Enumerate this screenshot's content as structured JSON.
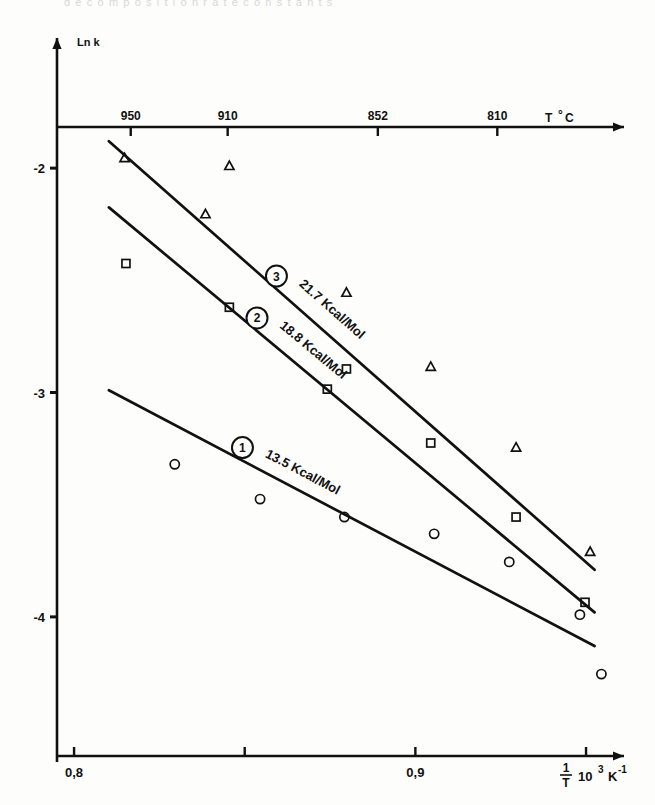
{
  "figure": {
    "kind": "arrhenius-plot",
    "background_color": "#fdfdfc",
    "ink_color": "#111111",
    "top_edge_artifact": "d e c o m p o s i t i o n   r a t e   c o n s t a n t s"
  },
  "chart_data": {
    "type": "scatter",
    "title": "",
    "subtitle": "",
    "xlabel": "1/T  10³ K⁻¹",
    "ylabel": "Ln k",
    "xlim": [
      0.795,
      0.962
    ],
    "ylim": [
      -4.62,
      -1.42
    ],
    "grid": false,
    "legend_position": "inline-on-curve",
    "x_axis": {
      "label": "1/T  10³ K⁻¹",
      "label_parts": {
        "fraction_numerator": "1",
        "fraction_denominator": "T",
        "mantissa": "10",
        "exponent": "3",
        "unit": "K",
        "unit_exponent": "-1"
      },
      "ticks": [
        {
          "value": 0.8,
          "label": "0,8"
        },
        {
          "value": 0.85,
          "label": ""
        },
        {
          "value": 0.9,
          "label": "0,9"
        },
        {
          "value": 0.95,
          "label": ""
        }
      ]
    },
    "y_axis": {
      "label": "Ln k",
      "ticks": [
        {
          "value": -2,
          "label": "-2"
        },
        {
          "value": -3,
          "label": "-3"
        },
        {
          "value": -4,
          "label": "-4"
        }
      ]
    },
    "secondary_x_axis": {
      "label": "T °C",
      "position": "top",
      "ticks": [
        {
          "value": 0.8166,
          "label": "950"
        },
        {
          "value": 0.845,
          "label": "910"
        },
        {
          "value": 0.889,
          "label": "852"
        },
        {
          "value": 0.924,
          "label": "810"
        }
      ]
    },
    "series": [
      {
        "id": "3",
        "badge": "3",
        "name": "21.7 Kcal/Mol",
        "activation_energy": 21.7,
        "activation_energy_units": "Kcal/Mol",
        "marker": "triangle-open",
        "annotation": "21.7 Kcal/Mol",
        "fit_line": {
          "x1": 0.8102,
          "y1": -1.88,
          "x2": 0.9525,
          "y2": -3.79
        },
        "points": [
          {
            "x": 0.8148,
            "y": -1.955
          },
          {
            "x": 0.8455,
            "y": -1.99
          },
          {
            "x": 0.8385,
            "y": -2.205
          },
          {
            "x": 0.8798,
            "y": -2.555
          },
          {
            "x": 0.9045,
            "y": -2.885
          },
          {
            "x": 0.9295,
            "y": -3.245
          },
          {
            "x": 0.9512,
            "y": -3.71
          }
        ]
      },
      {
        "id": "2",
        "badge": "2",
        "name": "18.8 Kcal/Mol",
        "activation_energy": 18.8,
        "activation_energy_units": "Kcal/Mol",
        "marker": "square-open",
        "annotation": "18.8 Kcal/Mol",
        "fit_line": {
          "x1": 0.8102,
          "y1": -2.175,
          "x2": 0.9525,
          "y2": -3.98
        },
        "points": [
          {
            "x": 0.8152,
            "y": -2.425
          },
          {
            "x": 0.8455,
            "y": -2.62
          },
          {
            "x": 0.8742,
            "y": -2.985
          },
          {
            "x": 0.8798,
            "y": -2.895
          },
          {
            "x": 0.9045,
            "y": -3.225
          },
          {
            "x": 0.9295,
            "y": -3.555
          },
          {
            "x": 0.9497,
            "y": -3.935
          }
        ]
      },
      {
        "id": "1",
        "badge": "1",
        "name": "13.5 Kcal/Mol",
        "activation_energy": 13.5,
        "activation_energy_units": "Kcal/Mol",
        "marker": "circle-open",
        "annotation": "13.5 Kcal/Mol",
        "fit_line": {
          "x1": 0.8102,
          "y1": -2.99,
          "x2": 0.9525,
          "y2": -4.13
        },
        "points": [
          {
            "x": 0.8295,
            "y": -3.32
          },
          {
            "x": 0.8545,
            "y": -3.475
          },
          {
            "x": 0.8792,
            "y": -3.555
          },
          {
            "x": 0.9055,
            "y": -3.63
          },
          {
            "x": 0.9275,
            "y": -3.755
          },
          {
            "x": 0.9482,
            "y": -3.99
          },
          {
            "x": 0.9545,
            "y": -4.255
          }
        ]
      }
    ]
  }
}
